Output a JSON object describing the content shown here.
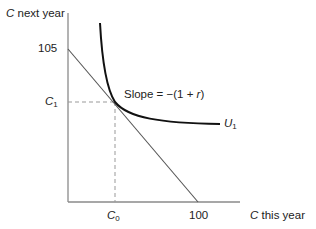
{
  "diagram": {
    "y_axis_label_var": "C",
    "y_axis_label_rest": " next year",
    "x_axis_label_var": "C",
    "x_axis_label_rest": " this year",
    "y_intercept_label": "105",
    "x_intercept_label": "100",
    "c1_var": "C",
    "c1_sub": "1",
    "c0_var": "C",
    "c0_sub": "0",
    "slope_label_prefix": "Slope = −(1 + ",
    "slope_label_var": "r",
    "slope_label_suffix": ")",
    "curve_label_var": "U",
    "curve_label_sub": "1"
  },
  "colors": {
    "axis": "#8a8a8a",
    "budget_line": "#555555",
    "indifference_curve": "#111111",
    "dashed_guides": "#999999"
  }
}
